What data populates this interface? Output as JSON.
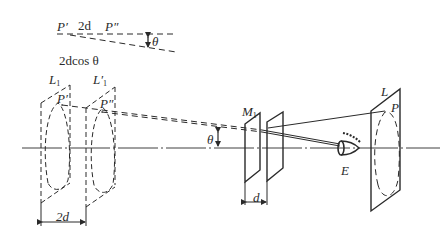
{
  "figure": {
    "type": "optics-diagram",
    "inset": {
      "p_prime": "P′",
      "spacing_label": "2d",
      "p_double_prime": "P″",
      "angle_label": "θ",
      "path_difference_label": "2dcos θ"
    },
    "labels": {
      "L1": "L",
      "L1_sub": "1",
      "L1_prime": "L′",
      "L1_prime_sub": "1",
      "P_prime_1": "P′",
      "P_prime_2": "P″",
      "theta": "θ",
      "M1": "M",
      "M1_sub": "1",
      "d": "d",
      "two_d": "2d",
      "L": "L",
      "P": "P",
      "E": "E"
    },
    "colors": {
      "line": "#2a2a2a",
      "background": "#ffffff"
    }
  }
}
